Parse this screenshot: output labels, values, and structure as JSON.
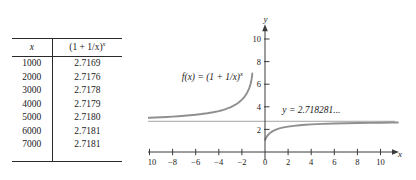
{
  "figure": {
    "kind": "math-textbook-figure",
    "background": "#ffffff",
    "ink_color": "#1a1a1a",
    "curve_color": "#8f8f8f",
    "axis_color": "#3b3b3b"
  },
  "table": {
    "columns": [
      {
        "key": "x",
        "label": "x",
        "italic": true
      },
      {
        "key": "fx",
        "label_base": "(1 + 1/x)",
        "label_sup": "x"
      }
    ],
    "rows": [
      {
        "x": "1000",
        "fx": "2.7169"
      },
      {
        "x": "2000",
        "fx": "2.7176"
      },
      {
        "x": "3000",
        "fx": "2.7178"
      },
      {
        "x": "4000",
        "fx": "2.7179"
      },
      {
        "x": "5000",
        "fx": "2.7180"
      },
      {
        "x": "6000",
        "fx": "2.7181"
      },
      {
        "x": "7000",
        "fx": "2.7181"
      }
    ]
  },
  "chart_data": {
    "type": "line",
    "title": "",
    "xlabel": "x",
    "ylabel": "y",
    "grid": false,
    "legend_position": "inline-annotation",
    "xlim": [
      -11.6,
      11.6
    ],
    "ylim": [
      -0.7,
      11.3
    ],
    "xticks": [
      -10,
      -8,
      -6,
      -4,
      -2,
      0,
      2,
      4,
      6,
      8,
      10
    ],
    "xticklabels": [
      "-10",
      "-8",
      "-6",
      "-4",
      "-2",
      "0",
      "2",
      "4",
      "6",
      "8",
      "10"
    ],
    "yticks": [
      2,
      4,
      6,
      8,
      10
    ],
    "yticklabels": [
      "2",
      "4",
      "6",
      "8",
      "10"
    ],
    "annotations": [
      {
        "name": "function-label",
        "text_base": "f(x) = (1 + 1/x)",
        "text_sup": "x",
        "x": -7.2,
        "y": 6.4
      },
      {
        "name": "asymptote-label",
        "text": "y = 2.718281...",
        "x": 1.5,
        "y": 3.45
      }
    ],
    "asymptote": {
      "kind": "horizontal",
      "value": 2.718281,
      "label": "y = 2.718281..."
    },
    "vertical_asymptote": -1,
    "series": [
      {
        "name": "f(x) = (1 + 1/x)^x  (left branch, x < -1)",
        "x": [
          -11.5,
          -11,
          -10.5,
          -10,
          -9.5,
          -9,
          -8.5,
          -8,
          -7.5,
          -7,
          -6.5,
          -6,
          -5.5,
          -5,
          -4.5,
          -4,
          -3.8,
          -3.6,
          -3.4,
          -3.2,
          -3,
          -2.8,
          -2.6,
          -2.4,
          -2.2,
          -2,
          -1.9,
          -1.8,
          -1.7,
          -1.6,
          -1.5,
          -1.4,
          -1.35,
          -1.3,
          -1.25,
          -1.2,
          -1.16,
          -1.13,
          -1.11,
          -1.1
        ],
        "y": [
          2.974,
          2.991,
          3.009,
          3.029,
          3.051,
          3.075,
          3.102,
          3.132,
          3.166,
          3.204,
          3.248,
          3.299,
          3.358,
          3.43,
          3.516,
          3.623,
          3.676,
          3.734,
          3.8,
          3.874,
          3.958,
          4.053,
          4.164,
          4.293,
          4.446,
          4.63,
          4.737,
          4.857,
          4.994,
          5.152,
          5.339,
          5.564,
          5.697,
          5.848,
          6.024,
          6.233,
          6.447,
          6.654,
          6.829,
          6.945
        ]
      },
      {
        "name": "f(x) = (1 + 1/x)^x  (right branch, x > 0)",
        "x": [
          0.02,
          0.05,
          0.1,
          0.2,
          0.3,
          0.4,
          0.5,
          0.6,
          0.8,
          1,
          1.25,
          1.5,
          1.75,
          2,
          2.5,
          3,
          3.5,
          4,
          5,
          6,
          7,
          8,
          9,
          10,
          11,
          11.5
        ],
        "y": [
          1.083,
          1.166,
          1.271,
          1.431,
          1.552,
          1.65,
          1.732,
          1.803,
          1.919,
          2.0,
          2.09,
          2.152,
          2.198,
          2.25,
          2.315,
          2.37,
          2.411,
          2.441,
          2.488,
          2.522,
          2.546,
          2.566,
          2.581,
          2.594,
          2.605,
          2.61
        ]
      }
    ]
  }
}
